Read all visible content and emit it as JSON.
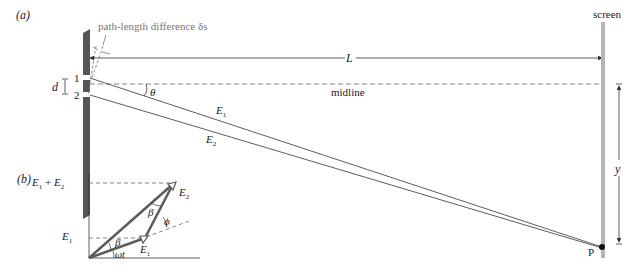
{
  "figure": {
    "cropped_header_text": "",
    "panel_a": {
      "label": "(a)",
      "path_length_label": "path-length difference δs",
      "distance_label": "L",
      "midline_label": "midline",
      "screen_label": "screen",
      "slit_separation_label": "d",
      "slit_1_label": "1",
      "slit_2_label": "2",
      "angle_label": "θ",
      "ray_1_label": "E",
      "ray_1_sub": "1",
      "ray_2_label": "E",
      "ray_2_sub": "2",
      "height_label": "y",
      "point_label": "P"
    },
    "panel_b": {
      "label": "(b)",
      "sum_label_a": "E",
      "sum_label_a_sub": "1",
      "sum_label_plus": " + ",
      "sum_label_b": "E",
      "sum_label_b_sub": "2",
      "axis_e1_label": "E",
      "axis_e1_sub": "1",
      "phasor_e1_label": "E",
      "phasor_e1_sub": "1",
      "phasor_e2_label": "E",
      "phasor_e2_sub": "2",
      "beta_top": "β",
      "beta_bottom": "β",
      "phi_label": "ϕ",
      "omega_t_label": "ωt"
    },
    "colors": {
      "barrier": "#555555",
      "screen": "#b5b5b5",
      "phasor": "#5a5a5a",
      "line": "#333333",
      "dashed": "#666666"
    }
  }
}
